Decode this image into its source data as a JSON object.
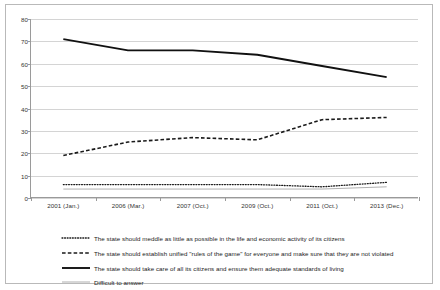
{
  "chart_data": {
    "type": "line",
    "title": "",
    "subtitle": "",
    "xlabel": "",
    "ylabel": "",
    "ylim": [
      0,
      80
    ],
    "ytick_step": 10,
    "yticks": [
      "0",
      "10",
      "20",
      "30",
      "40",
      "50",
      "60",
      "70",
      "80"
    ],
    "grid": true,
    "legend_position": "bottom-left",
    "categories": [
      "2001 (Jan.)",
      "2006 (Mar.)",
      "2007 (Oct.)",
      "2009 (Oct.)",
      "2011 (Oct.)",
      "2013 (Dec.)"
    ],
    "series": [
      {
        "name": "The state should meddle as little as possible in the life and economic activity of its citizens",
        "style": "dotted",
        "color": "#1a1a1a",
        "values": [
          6,
          6,
          6,
          6,
          5,
          7
        ]
      },
      {
        "name": "The state should establish unified \"rules of the game\" for everyone and make sure that they are not violated",
        "style": "dashed",
        "color": "#1a1a1a",
        "values": [
          19,
          25,
          27,
          26,
          35,
          36
        ]
      },
      {
        "name": "The state should take care of all its citizens and ensure them adequate standards of living",
        "style": "solid",
        "color": "#111111",
        "values": [
          71,
          66,
          66,
          64,
          59,
          54
        ]
      },
      {
        "name": "Difficult to answer",
        "style": "thin",
        "color": "#9a9a9a",
        "values": [
          4,
          4,
          4,
          4,
          4,
          5
        ]
      }
    ]
  },
  "legend": {
    "items": [
      {
        "label": "The state should meddle as little as possible in the life and economic activity of its citizens",
        "marker": "dotted-line-swatch"
      },
      {
        "label": "The state should establish unified \"rules of the game\" for everyone and make sure that they are not violated",
        "marker": "dashed-line-swatch"
      },
      {
        "label": "The state should take care of all its citizens and ensure them adequate standards of living",
        "marker": "solid-line-swatch"
      },
      {
        "label": "Difficult to answer",
        "marker": "thin-line-swatch"
      }
    ]
  }
}
